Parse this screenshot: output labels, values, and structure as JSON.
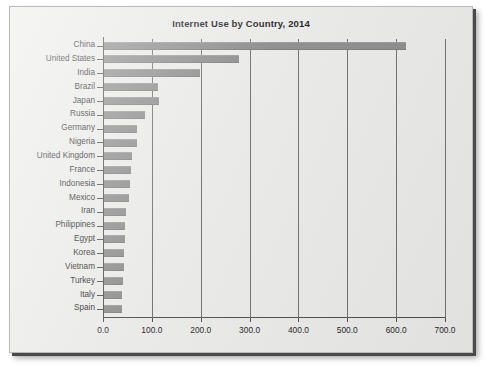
{
  "chart_data": {
    "type": "bar",
    "orientation": "horizontal",
    "title": "Internet Use by Country, 2014",
    "xlabel": "",
    "ylabel": "",
    "xlim": [
      0,
      700
    ],
    "ylim": null,
    "grid": true,
    "legend": null,
    "xticks": [
      "0.0",
      "100.0",
      "200.0",
      "300.0",
      "400.0",
      "500.0",
      "600.0",
      "700.0"
    ],
    "xtick_values": [
      0,
      100,
      200,
      300,
      400,
      500,
      600,
      700
    ],
    "categories": [
      "China",
      "United States",
      "India",
      "Brazil",
      "Japan",
      "Russia",
      "Germany",
      "Nigeria",
      "United Kingdom",
      "France",
      "Indonesia",
      "Mexico",
      "Iran",
      "Philippines",
      "Egypt",
      "Korea",
      "Vietnam",
      "Turkey",
      "Italy",
      "Spain"
    ],
    "values": [
      618,
      277,
      197,
      110,
      112,
      84,
      68,
      68,
      57,
      55,
      54,
      51,
      45,
      44,
      43,
      41,
      41,
      39,
      37,
      37
    ],
    "colors": {
      "bar": "#8b8b8b",
      "background": "#e9e9e7",
      "axis": "#4d4d4d",
      "gridline": "#6f6f6f",
      "text": "#1f1f1f"
    }
  }
}
